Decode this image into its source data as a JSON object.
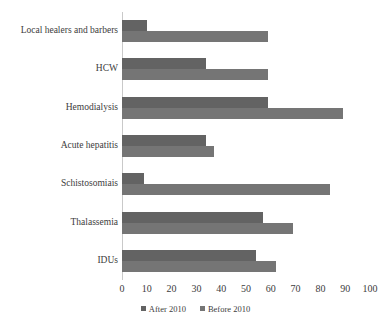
{
  "chart_data": {
    "type": "bar",
    "orientation": "horizontal",
    "title": "",
    "xlabel": "",
    "ylabel": "",
    "xlim": [
      0,
      100
    ],
    "xticks": [
      0,
      10,
      20,
      30,
      40,
      50,
      60,
      70,
      80,
      90,
      100
    ],
    "grid": false,
    "legend_position": "bottom-center",
    "categories": [
      "Local healers and barbers",
      "HCW",
      "Hemodialysis",
      "Acute hepatitis",
      "Schistosomiais",
      "Thalassemia",
      "IDUs"
    ],
    "series": [
      {
        "name": "After 2010",
        "color": "#636363",
        "values": [
          10,
          34,
          59,
          34,
          9,
          57,
          54
        ]
      },
      {
        "name": "Before 2010",
        "color": "#757575",
        "values": [
          59,
          59,
          89,
          37,
          84,
          69,
          62
        ]
      }
    ]
  },
  "colors": {
    "after_2010": "#636363",
    "before_2010": "#757575",
    "axis": "#c9c9c9",
    "text": "#3c3c3c",
    "background": "#ffffff"
  }
}
